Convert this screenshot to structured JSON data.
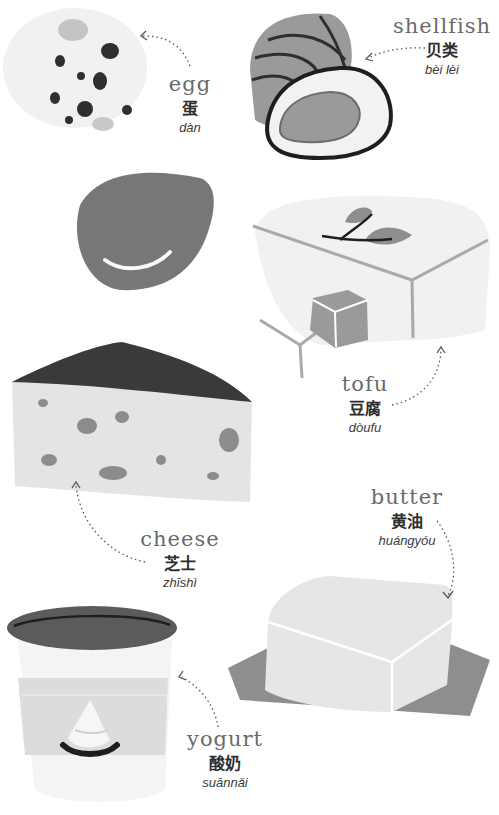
{
  "items": [
    {
      "id": "egg",
      "english": "egg",
      "chinese": "蛋",
      "pinyin": "dàn"
    },
    {
      "id": "shellfish",
      "english": "shellfish",
      "chinese": "贝类",
      "pinyin": "bèi lèi"
    },
    {
      "id": "tofu",
      "english": "tofu",
      "chinese": "豆腐",
      "pinyin": "dòufu"
    },
    {
      "id": "cheese",
      "english": "cheese",
      "chinese": "芝士",
      "pinyin": "zhīshì"
    },
    {
      "id": "butter",
      "english": "butter",
      "chinese": "黄油",
      "pinyin": "huángyóu"
    },
    {
      "id": "yogurt",
      "english": "yogurt",
      "chinese": "酸奶",
      "pinyin": "suānnǎi"
    }
  ],
  "colors": {
    "dark": "#3a3a3a",
    "mid": "#8c8c8c",
    "shell": "#9a9a9a",
    "light": "#e6e6e6",
    "pale": "#f2f2f2",
    "egg_dark": "#7a7a7a"
  }
}
